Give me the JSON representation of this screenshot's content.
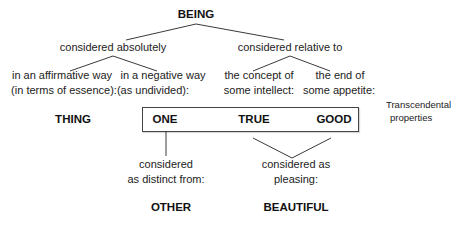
{
  "diagram": {
    "root": "BEING",
    "branches": {
      "absolute": {
        "label": "considered absolutely",
        "affirmative": {
          "line1": "in an affirmative way",
          "line2": "(in terms of essence):",
          "result": "THING"
        },
        "negative": {
          "line1": "in a negative way",
          "line2": "(as undivided):",
          "result": "ONE"
        }
      },
      "relative": {
        "label": "considered relative to",
        "intellect": {
          "line1": "the concept of",
          "line2": "some intellect:",
          "result": "TRUE"
        },
        "appetite": {
          "line1": "the end of",
          "line2": "some appetite:",
          "result": "GOOD"
        }
      }
    },
    "transcendental_label": {
      "line1": "Transcendental",
      "line2": "properties"
    },
    "derived": {
      "distinct": {
        "line1": "considered",
        "line2": "as distinct from:",
        "result": "OTHER"
      },
      "pleasing": {
        "line1": "considered as",
        "line2": "pleasing:",
        "result": "BEAUTIFUL"
      }
    }
  }
}
